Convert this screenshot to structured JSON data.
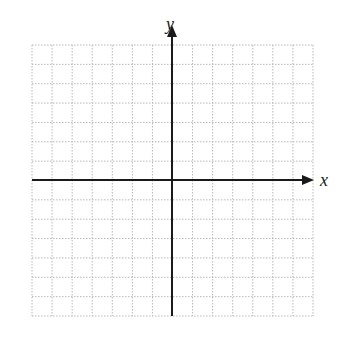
{
  "diagram": {
    "type": "coordinate-plane",
    "x_axis_label": "x",
    "y_axis_label": "y",
    "grid": {
      "columns": 14,
      "rows": 14,
      "left": 32,
      "top": 45,
      "right": 313,
      "bottom": 316,
      "line_style": "dotted",
      "line_color": "#b8b8b8"
    },
    "axes": {
      "color": "#1a1a1a",
      "origin_x": 172,
      "origin_y": 180,
      "x_arrow_end": 312,
      "y_arrow_end": 26
    }
  }
}
